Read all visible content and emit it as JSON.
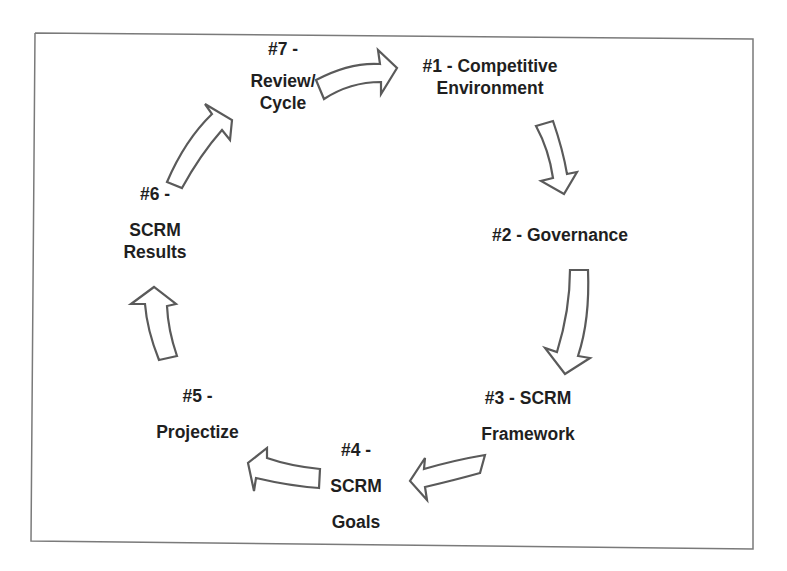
{
  "diagram": {
    "type": "cycle",
    "border_color": "#7a7a7a",
    "arrow_stroke_color": "#5a5a5a",
    "arrow_fill_color": "#ffffff",
    "text_color": "#1f1f1f",
    "steps": [
      {
        "id": 1,
        "line1": "#1 - Competitive",
        "line2": "Environment"
      },
      {
        "id": 2,
        "line1": "#2 - Governance"
      },
      {
        "id": 3,
        "line1": "#3 - SCRM",
        "line2": "Framework"
      },
      {
        "id": 4,
        "line1": "#4 -",
        "line2": "SCRM",
        "line3": "Goals"
      },
      {
        "id": 5,
        "line1": "#5 -",
        "line2": "Projectize"
      },
      {
        "id": 6,
        "line1": "#6 -",
        "line2": "SCRM",
        "line3": "Results"
      },
      {
        "id": 7,
        "line1": "#7 -",
        "line2": "Review/",
        "line3": "Cycle"
      }
    ],
    "arrows": [
      {
        "from": 7,
        "to": 1,
        "direction": "right"
      },
      {
        "from": 1,
        "to": 2,
        "direction": "down"
      },
      {
        "from": 2,
        "to": 3,
        "direction": "down"
      },
      {
        "from": 3,
        "to": 4,
        "direction": "left"
      },
      {
        "from": 4,
        "to": 5,
        "direction": "left"
      },
      {
        "from": 5,
        "to": 6,
        "direction": "up"
      },
      {
        "from": 6,
        "to": 7,
        "direction": "up-right"
      }
    ]
  }
}
